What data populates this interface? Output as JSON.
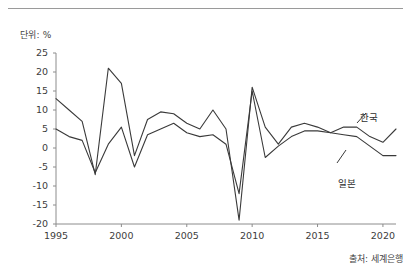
{
  "unit_label": "단위: %",
  "source_label": "출처: 세계은행",
  "chart_data": {
    "type": "line",
    "title": "",
    "subtitle": "",
    "xlabel": "",
    "ylabel": "",
    "unit": "%",
    "grid": false,
    "legend_position": "inline-right",
    "source": "출처: 세계은행",
    "xlim": [
      1995,
      2021
    ],
    "ylim": [
      -20,
      25
    ],
    "ytick_labels": [
      "25",
      "20",
      "15",
      "10",
      "5",
      "0",
      "-5",
      "-10",
      "-15",
      "-20"
    ],
    "ytick_values": [
      25,
      20,
      15,
      10,
      5,
      0,
      -5,
      -10,
      -15,
      -20
    ],
    "xtick_labels": [
      "1995",
      "2000",
      "2005",
      "2010",
      "2015",
      "2020"
    ],
    "xtick_values": [
      1995,
      2000,
      2005,
      2010,
      2015,
      2020
    ],
    "x": [
      1995,
      1996,
      1997,
      1998,
      1999,
      2000,
      2001,
      2002,
      2003,
      2004,
      2005,
      2006,
      2007,
      2008,
      2009,
      2010,
      2011,
      2012,
      2013,
      2014,
      2015,
      2016,
      2017,
      2018,
      2019,
      2020,
      2021
    ],
    "series": [
      {
        "name": "한국",
        "label": "한국",
        "color": "#3a3a3a",
        "values": [
          13.0,
          10.0,
          7.0,
          -7.0,
          21.0,
          17.0,
          -2.0,
          7.5,
          9.5,
          9.0,
          6.5,
          5.0,
          10.0,
          5.0,
          -19.0,
          16.0,
          5.5,
          1.0,
          5.5,
          6.5,
          5.5,
          4.0,
          5.5,
          5.5,
          3.0,
          1.5,
          5.0
        ]
      },
      {
        "name": "일본",
        "label": "일본",
        "color": "#3a3a3a",
        "values": [
          5.0,
          3.0,
          2.0,
          -6.5,
          1.0,
          5.5,
          -5.0,
          3.5,
          5.0,
          6.5,
          4.0,
          3.0,
          3.5,
          1.0,
          -12.0,
          15.0,
          -2.5,
          0.5,
          3.0,
          4.5,
          4.5,
          4.0,
          3.5,
          3.0,
          0.5,
          -2.0,
          -2.0
        ]
      }
    ],
    "annotations": [
      {
        "name": "한국",
        "text": "한국",
        "x_px": 360,
        "y_px": 110
      },
      {
        "name": "일본",
        "text": "일본",
        "x_px": 338,
        "y_px": 176
      }
    ]
  }
}
